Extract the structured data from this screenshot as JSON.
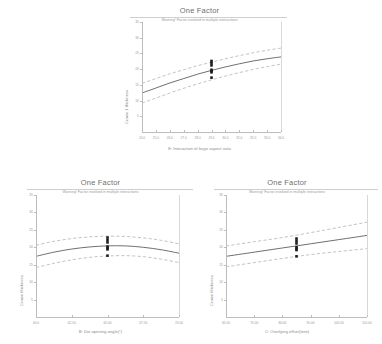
{
  "figure": {
    "background": "#ffffff",
    "line_color": "#4a4a4a",
    "band_color": "#9b9b9b",
    "point_color": "#1c1c1c",
    "axis_color": "#bdbdbd"
  },
  "chart_data": [
    {
      "id": "panel-top",
      "type": "line",
      "title": "One Factor",
      "subtitle": "Warning! Factor involved in multiple interactions",
      "xlabel": "E: Interaction of large aspect ratio",
      "ylabel": "Crown 1 thickness",
      "xlim": [
        24.0,
        34.0
      ],
      "ylim": [
        0.0,
        35.0
      ],
      "xticks": [
        "24.0",
        "25.0",
        "26.0",
        "27.0",
        "28.0",
        "29.0",
        "30.0",
        "31.0",
        "32.0",
        "33.0",
        "34.0"
      ],
      "yticks": [
        "35",
        "30",
        "25",
        "20",
        "15",
        "10",
        "5"
      ],
      "grid": false,
      "legend": "none",
      "series": [
        {
          "name": "Predicted mean",
          "style": "solid",
          "x": [
            24.0,
            25.0,
            26.0,
            27.0,
            28.0,
            29.0,
            30.0,
            31.0,
            32.0,
            33.0,
            34.0
          ],
          "values": [
            12.4,
            14.0,
            15.6,
            17.0,
            18.4,
            19.6,
            20.7,
            21.7,
            22.6,
            23.3,
            23.9
          ]
        },
        {
          "name": "95% CI high",
          "style": "dashed",
          "x": [
            24.0,
            25.0,
            26.0,
            27.0,
            28.0,
            29.0,
            30.0,
            31.0,
            32.0,
            33.0,
            34.0
          ],
          "values": [
            15.5,
            17.0,
            18.5,
            19.8,
            21.1,
            22.2,
            23.3,
            24.3,
            25.2,
            26.0,
            26.7
          ]
        },
        {
          "name": "95% CI low",
          "style": "dashed",
          "x": [
            24.0,
            25.0,
            26.0,
            27.0,
            28.0,
            29.0,
            30.0,
            31.0,
            32.0,
            33.0,
            34.0
          ],
          "values": [
            9.2,
            10.8,
            12.4,
            13.9,
            15.3,
            16.6,
            17.8,
            18.9,
            19.9,
            20.8,
            21.6
          ]
        }
      ],
      "points": {
        "name": "Design points",
        "x": [
          29.0,
          29.0,
          29.0,
          29.0,
          29.0,
          29.0,
          29.0
        ],
        "values": [
          22.6,
          21.9,
          21.2,
          19.8,
          19.4,
          19.0,
          17.3
        ]
      }
    },
    {
      "id": "panel-bl",
      "type": "line",
      "title": "One Factor",
      "subtitle": "Warning! Factor involved in multiple interactions",
      "xlabel": "B: Die opening angle(°)",
      "ylabel": "Crown thickness",
      "xlim": [
        60.0,
        70.0
      ],
      "ylim": [
        0.0,
        35.0
      ],
      "xticks": [
        "60.0",
        "62.50",
        "65.00",
        "67.50",
        "70.00"
      ],
      "yticks": [
        "35",
        "30",
        "25",
        "20",
        "15",
        "10",
        "5"
      ],
      "grid": false,
      "legend": "none",
      "series": [
        {
          "name": "Predicted mean",
          "style": "solid",
          "x": [
            60.0,
            61.25,
            62.5,
            63.75,
            65.0,
            66.25,
            67.5,
            68.75,
            70.0
          ],
          "values": [
            17.4,
            18.6,
            19.5,
            20.1,
            20.4,
            20.4,
            20.0,
            19.3,
            18.3
          ]
        },
        {
          "name": "95% CI high",
          "style": "dashed",
          "x": [
            60.0,
            61.25,
            62.5,
            63.75,
            65.0,
            66.25,
            67.5,
            68.75,
            70.0
          ],
          "values": [
            20.6,
            21.7,
            22.5,
            23.0,
            23.2,
            23.1,
            22.7,
            22.0,
            21.0
          ]
        },
        {
          "name": "95% CI low",
          "style": "dashed",
          "x": [
            60.0,
            61.25,
            62.5,
            63.75,
            65.0,
            66.25,
            67.5,
            68.75,
            70.0
          ],
          "values": [
            14.2,
            15.4,
            16.4,
            17.1,
            17.5,
            17.6,
            17.3,
            16.6,
            15.6
          ]
        }
      ],
      "points": {
        "name": "Design points",
        "x": [
          65.0,
          65.0,
          65.0,
          65.0,
          65.0,
          65.0,
          65.0
        ],
        "values": [
          22.8,
          22.1,
          21.4,
          20.2,
          19.8,
          19.4,
          17.6
        ]
      }
    },
    {
      "id": "panel-br",
      "type": "line",
      "title": "One Factor",
      "subtitle": "Warning! Factor involved in multiple interactions",
      "xlabel": "C: Overlying offset(mm)",
      "ylabel": "Crown thickness",
      "xlim": [
        60.0,
        110.0
      ],
      "ylim": [
        0.0,
        35.0
      ],
      "xticks": [
        "60.00",
        "70.00",
        "80.00",
        "90.00",
        "100.00",
        "110.00"
      ],
      "yticks": [
        "35",
        "30",
        "25",
        "20",
        "15",
        "10",
        "5"
      ],
      "grid": false,
      "legend": "none",
      "series": [
        {
          "name": "Predicted mean",
          "style": "solid",
          "x": [
            60.0,
            70.0,
            80.0,
            90.0,
            100.0,
            110.0
          ],
          "values": [
            17.4,
            18.6,
            19.8,
            21.0,
            22.2,
            23.4
          ]
        },
        {
          "name": "95% CI high",
          "style": "dashed",
          "x": [
            60.0,
            70.0,
            80.0,
            90.0,
            100.0,
            110.0
          ],
          "values": [
            20.4,
            21.6,
            22.8,
            24.2,
            25.7,
            27.2
          ]
        },
        {
          "name": "95% CI low",
          "style": "dashed",
          "x": [
            60.0,
            70.0,
            80.0,
            90.0,
            100.0,
            110.0
          ],
          "values": [
            14.4,
            15.6,
            16.8,
            17.9,
            18.8,
            19.6
          ]
        }
      ],
      "points": {
        "name": "Design points",
        "x": [
          85.0,
          85.0,
          85.0,
          85.0,
          85.0,
          85.0,
          85.0
        ],
        "values": [
          22.5,
          21.8,
          21.1,
          20.0,
          19.6,
          19.2,
          17.4
        ]
      }
    }
  ]
}
